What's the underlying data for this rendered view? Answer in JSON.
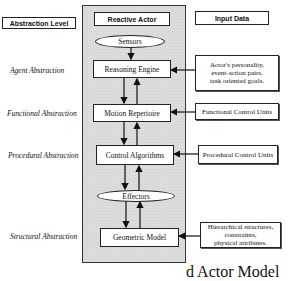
{
  "headers": {
    "abstraction_level": "Abstraction Level",
    "reactive_actor": "Reactive Actor",
    "input_data": "Input Data"
  },
  "levels": [
    {
      "label": "Agent Abstraction"
    },
    {
      "label": "Functional Abstraction"
    },
    {
      "label": "Procedural Abstraction"
    },
    {
      "label": "Structural Abstraction"
    }
  ],
  "actor": {
    "sensors": "Sensors",
    "reasoning_engine": "Reasoning Engine",
    "motion_repertoire": "Motion Repertoire",
    "control_algorithms": "Control Algorithms",
    "effectors": "Effectors",
    "geometric_model": "Geometric Model"
  },
  "inputs": [
    {
      "lines": [
        "Actor's personality,",
        "event-action pairs,",
        "task oriented goals."
      ]
    },
    {
      "lines": [
        "Functional  Control Units"
      ]
    },
    {
      "lines": [
        "Procedural Control Units"
      ]
    },
    {
      "lines": [
        "Hierarchical structures,",
        "constraints,",
        "physical attributes."
      ]
    }
  ],
  "caption": "d Actor Model",
  "colors": {
    "panel": "#dcdcdc",
    "stroke": "#222222",
    "background": "#ffffff"
  }
}
